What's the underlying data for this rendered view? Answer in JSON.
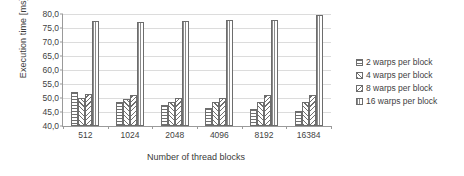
{
  "chart_data": {
    "type": "bar",
    "title": "",
    "xlabel": "Number of thread blocks",
    "ylabel": "Execution time [ms]",
    "categories": [
      "512",
      "1024",
      "2048",
      "4096",
      "8192",
      "16384"
    ],
    "series": [
      {
        "name": "2 warps per block",
        "pattern": "horizontal-lines",
        "values": [
          52.0,
          48.5,
          47.5,
          46.5,
          46.0,
          45.5
        ]
      },
      {
        "name": "4 warps per block",
        "pattern": "diagonal-hatch",
        "values": [
          50.0,
          49.5,
          48.5,
          48.5,
          48.5,
          48.5
        ]
      },
      {
        "name": "8 warps per block",
        "pattern": "diagonal-hatch-2",
        "values": [
          51.5,
          51.0,
          50.0,
          50.0,
          51.0,
          51.0
        ]
      },
      {
        "name": "16 warps per block",
        "pattern": "vertical-lines",
        "values": [
          77.5,
          77.3,
          77.5,
          78.0,
          78.0,
          79.5
        ]
      }
    ],
    "ylim": [
      40.0,
      80.0
    ],
    "ytick_step": 5.0,
    "ytick_labels": [
      "80,0",
      "75,0",
      "70,0",
      "65,0",
      "60,0",
      "55,0",
      "50,0",
      "45,0",
      "40,0"
    ],
    "ytick_values": [
      80.0,
      75.0,
      70.0,
      65.0,
      60.0,
      55.0,
      50.0,
      45.0,
      40.0
    ],
    "grid": true,
    "legend_position": "right",
    "decimal_separator": ","
  },
  "legend": {
    "items": [
      {
        "label": "2 warps per block"
      },
      {
        "label": "4 warps per block"
      },
      {
        "label": "8 warps per block"
      },
      {
        "label": "16 warps per block"
      }
    ]
  },
  "colors": {
    "axis": "#9a9a9a",
    "grid": "#dcdcdc",
    "bar_outline": "#6d6d6d",
    "text": "#3f3f3f",
    "background": "#ffffff"
  }
}
